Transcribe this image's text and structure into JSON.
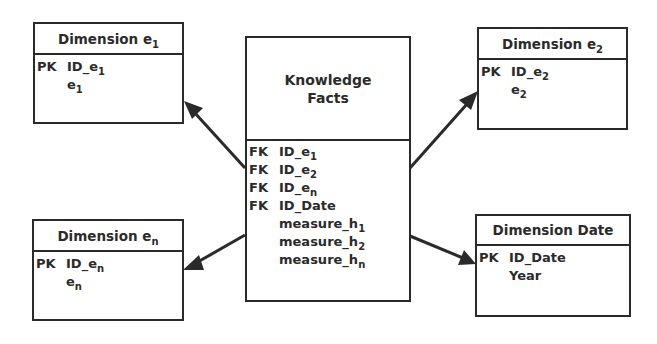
{
  "diagram": {
    "type": "star-schema",
    "fact_table": {
      "title_line1": "Knowledge",
      "title_line2": "Facts",
      "fields": [
        {
          "key": "FK",
          "name": "ID_e",
          "sub": "1"
        },
        {
          "key": "FK",
          "name": "ID_e",
          "sub": "2"
        },
        {
          "key": "FK",
          "name": "ID_e",
          "sub": "n"
        },
        {
          "key": "FK",
          "name": "ID_Date",
          "sub": ""
        },
        {
          "key": "",
          "name": "measure_h",
          "sub": "1"
        },
        {
          "key": "",
          "name": "measure_h",
          "sub": "2"
        },
        {
          "key": "",
          "name": "measure_h",
          "sub": "n"
        }
      ]
    },
    "dimensions": {
      "e1": {
        "title": "Dimension e",
        "title_sub": "1",
        "fields": [
          {
            "key": "PK",
            "name": "ID_e",
            "sub": "1"
          },
          {
            "key": "",
            "name": "e",
            "sub": "1"
          }
        ]
      },
      "e2": {
        "title": "Dimension e",
        "title_sub": "2",
        "fields": [
          {
            "key": "PK",
            "name": "ID_e",
            "sub": "2"
          },
          {
            "key": "",
            "name": "e",
            "sub": "2"
          }
        ]
      },
      "en": {
        "title": "Dimension e",
        "title_sub": "n",
        "fields": [
          {
            "key": "PK",
            "name": "ID_e",
            "sub": "n"
          },
          {
            "key": "",
            "name": "e",
            "sub": "n"
          }
        ]
      },
      "date": {
        "title": "Dimension Date",
        "title_sub": "",
        "fields": [
          {
            "key": "PK",
            "name": "ID_Date",
            "sub": ""
          },
          {
            "key": "",
            "name": "Year",
            "sub": ""
          }
        ]
      }
    },
    "relationships": [
      {
        "from": "Knowledge Facts",
        "to": "Dimension e1"
      },
      {
        "from": "Knowledge Facts",
        "to": "Dimension e2"
      },
      {
        "from": "Knowledge Facts",
        "to": "Dimension en"
      },
      {
        "from": "Knowledge Facts",
        "to": "Dimension Date"
      }
    ],
    "colors": {
      "line": "#2a2a2a",
      "text": "#2b2b2b",
      "background": "#ffffff"
    }
  }
}
